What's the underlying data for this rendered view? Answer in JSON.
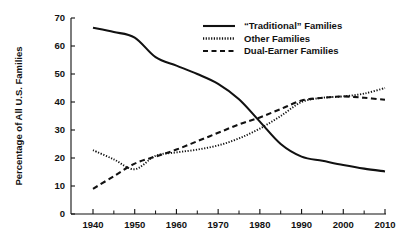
{
  "chart_data": {
    "type": "line",
    "title": "",
    "subtitle": "",
    "xlabel": "",
    "ylabel": "Percentage of All U.S. Families",
    "xlim": [
      1940,
      2010
    ],
    "ylim": [
      0,
      70
    ],
    "grid": false,
    "legend_position": "top-right",
    "x_ticks": [
      1940,
      1950,
      1960,
      1970,
      1980,
      1990,
      2000,
      2010
    ],
    "x_tick_labels": [
      "1940",
      "1950",
      "1960",
      "1970",
      "1980",
      "1990",
      "2000",
      "2010"
    ],
    "x_minor_tick_step": 5,
    "y_ticks": [
      0,
      10,
      20,
      30,
      40,
      50,
      60,
      70
    ],
    "y_tick_labels": [
      "0",
      "10",
      "20",
      "30",
      "40",
      "50",
      "60",
      "70"
    ],
    "x": [
      1940,
      1945,
      1950,
      1955,
      1960,
      1965,
      1970,
      1975,
      1980,
      1985,
      1990,
      1995,
      2000,
      2005,
      2010
    ],
    "series": [
      {
        "name": "“Traditional” Families",
        "style": "solid",
        "color": "#111111",
        "values": [
          66.5,
          65.0,
          63.0,
          56.0,
          53.0,
          50.0,
          46.5,
          41.0,
          33.0,
          25.0,
          20.5,
          19.0,
          17.5,
          16.2,
          15.2
        ]
      },
      {
        "name": "Other Families",
        "style": "dotted",
        "color": "#111111",
        "values": [
          22.8,
          19.5,
          16.0,
          20.8,
          22.0,
          23.0,
          24.5,
          27.0,
          30.5,
          35.0,
          40.0,
          41.5,
          42.0,
          43.0,
          45.0
        ]
      },
      {
        "name": "Dual-Earner Families",
        "style": "dashed",
        "color": "#111111",
        "values": [
          9.0,
          13.5,
          18.0,
          20.5,
          23.0,
          26.0,
          29.0,
          32.0,
          34.5,
          37.5,
          40.5,
          41.5,
          42.0,
          41.5,
          40.8
        ]
      }
    ]
  },
  "legend": {
    "items": [
      {
        "label": "“Traditional” Families",
        "style": "solid"
      },
      {
        "label": "Other Families",
        "style": "dotted"
      },
      {
        "label": "Dual-Earner Families",
        "style": "dashed"
      }
    ]
  },
  "colors": {
    "ink": "#111111",
    "background": "#ffffff"
  }
}
